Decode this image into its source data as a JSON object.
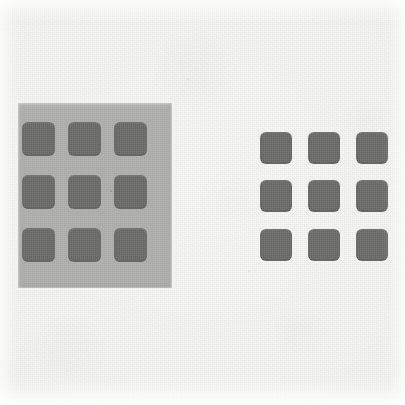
{
  "figure": {
    "kind": "simultaneous-lightness-contrast-demonstration",
    "canvas": {
      "width": 405,
      "height": 405
    },
    "paper_color": "#f4f4f2",
    "media": "scanned-print"
  },
  "stimuli": [
    {
      "id": "left-stimulus",
      "name": "gray-surround-stimulus",
      "surround": {
        "name": "gray-surround-panel",
        "color": "#b2b2b0",
        "x": 18,
        "y": 103,
        "width": 154,
        "height": 185
      },
      "grid": {
        "name": "left-patch-grid",
        "rows": 3,
        "cols": 3,
        "count": 9,
        "patch_color": "#6c6c6a",
        "patch_width": 33,
        "patch_height": 34,
        "corner_radius": 6,
        "col_x": [
          22,
          68,
          114
        ],
        "row_y": [
          122,
          175,
          228
        ]
      }
    },
    {
      "id": "right-stimulus",
      "name": "white-surround-stimulus",
      "surround": {
        "name": "paper-surround",
        "color": "#f4f4f2"
      },
      "grid": {
        "name": "right-patch-grid",
        "rows": 3,
        "cols": 3,
        "count": 9,
        "patch_color": "#6c6c6a",
        "patch_width": 32,
        "patch_height": 32,
        "corner_radius": 6,
        "col_x": [
          260,
          308,
          356
        ],
        "row_y": [
          132,
          180,
          229
        ]
      }
    }
  ],
  "artifacts": {
    "specks": [
      {
        "name": "scan-speck",
        "x": 110,
        "y": 190,
        "size": 2,
        "color": "#8d8d8b"
      },
      {
        "name": "scan-speck",
        "x": 187,
        "y": 78,
        "size": 2,
        "color": "#dcdcda"
      },
      {
        "name": "scan-speck",
        "x": 248,
        "y": 270,
        "size": 2,
        "color": "#dedede"
      }
    ]
  }
}
